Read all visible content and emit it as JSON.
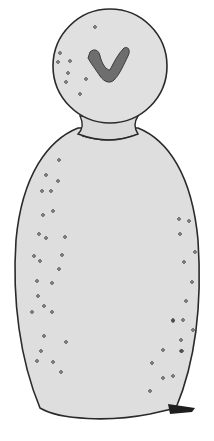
{
  "illustration": {
    "subject": "bottle-shaped figure with a round head and a V-shaped mark",
    "colors": {
      "background": "#ffffff",
      "body_fill": "#dedede",
      "outline": "#2a2a2a",
      "mark": "#6e6e6e",
      "shadow": "#1e1e1e"
    },
    "head_bubbles": [
      [
        95,
        27
      ],
      [
        60,
        53
      ],
      [
        58,
        62
      ],
      [
        70,
        61
      ],
      [
        68,
        73
      ],
      [
        66,
        82
      ],
      [
        86,
        79
      ],
      [
        80,
        94
      ]
    ],
    "body_bubbles": [
      [
        59,
        160
      ],
      [
        46,
        175
      ],
      [
        58,
        181
      ],
      [
        42,
        191
      ],
      [
        51,
        191
      ],
      [
        43,
        215
      ],
      [
        53,
        211
      ],
      [
        39,
        234
      ],
      [
        46,
        238
      ],
      [
        65,
        237
      ],
      [
        34,
        256
      ],
      [
        40,
        261
      ],
      [
        62,
        255
      ],
      [
        37,
        281
      ],
      [
        59,
        269
      ],
      [
        52,
        283
      ],
      [
        38,
        296
      ],
      [
        44,
        306
      ],
      [
        32,
        312
      ],
      [
        52,
        312
      ],
      [
        179,
        219
      ],
      [
        189,
        221
      ],
      [
        180,
        234
      ],
      [
        195,
        252
      ],
      [
        184,
        262
      ],
      [
        192,
        282
      ],
      [
        186,
        301
      ],
      [
        173,
        321
      ],
      [
        183,
        320
      ],
      [
        44,
        336
      ],
      [
        41,
        351
      ],
      [
        37,
        361
      ],
      [
        53,
        362
      ],
      [
        66,
        342
      ],
      [
        61,
        372
      ],
      [
        173,
        320
      ],
      [
        181,
        340
      ],
      [
        193,
        330
      ],
      [
        181,
        351
      ],
      [
        163,
        350
      ],
      [
        182,
        351
      ],
      [
        152,
        363
      ],
      [
        173,
        376
      ],
      [
        163,
        378
      ],
      [
        150,
        391
      ]
    ]
  }
}
